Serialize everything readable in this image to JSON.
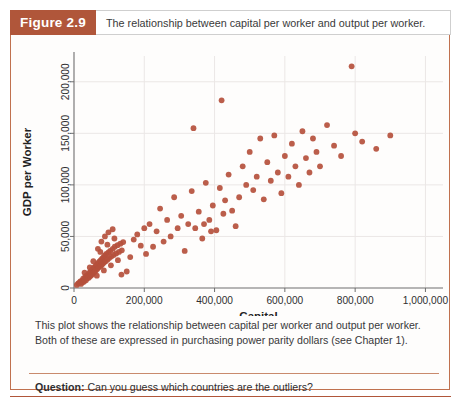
{
  "figure": {
    "tag_label": "Figure 2.9",
    "title": "The relationship between capital per worker and output per worker.",
    "caption": "This plot shows the relationship between capital per worker and output per worker. Both of these are expressed in purchasing power parity dollars (see Chapter 1).",
    "question_label": "Question:",
    "question_text": "Can you guess which countries are the outliers?"
  },
  "colors": {
    "banner": "#b0563a",
    "border": "#c0714f",
    "point": "#b5503c",
    "grid": "#ebe7e6",
    "axis": "#6e6e6e",
    "text": "#38383a"
  },
  "chart_data": {
    "type": "scatter",
    "title": "",
    "xlabel": "Capital",
    "ylabel": "GDP per Worker",
    "xlim": [
      0,
      1050000
    ],
    "ylim": [
      0,
      225000
    ],
    "grid": true,
    "legend": "none",
    "xticks": [
      0,
      200000,
      400000,
      600000,
      800000,
      1000000
    ],
    "xticklabels": [
      "0",
      "200,000",
      "400,000",
      "600,000",
      "800,000",
      "1,000,000"
    ],
    "yticks": [
      0,
      50000,
      100000,
      150000,
      200000
    ],
    "yticklabels": [
      "0",
      "50,000",
      "100,000",
      "150,000",
      "200,000"
    ],
    "points": [
      [
        8000,
        3000
      ],
      [
        12000,
        4500
      ],
      [
        15000,
        5000
      ],
      [
        18000,
        6500
      ],
      [
        20000,
        4000
      ],
      [
        22000,
        7000
      ],
      [
        24000,
        5500
      ],
      [
        26000,
        9000
      ],
      [
        28000,
        6000
      ],
      [
        30000,
        8000
      ],
      [
        32000,
        11000
      ],
      [
        34000,
        7500
      ],
      [
        36000,
        12000
      ],
      [
        38000,
        9500
      ],
      [
        40000,
        13000
      ],
      [
        42000,
        10000
      ],
      [
        44000,
        15000
      ],
      [
        46000,
        11500
      ],
      [
        48000,
        16000
      ],
      [
        50000,
        12500
      ],
      [
        52000,
        18000
      ],
      [
        54000,
        14000
      ],
      [
        56000,
        19500
      ],
      [
        58000,
        15500
      ],
      [
        60000,
        21000
      ],
      [
        62000,
        17000
      ],
      [
        64000,
        22500
      ],
      [
        66000,
        18500
      ],
      [
        68000,
        24000
      ],
      [
        70000,
        20000
      ],
      [
        72000,
        25500
      ],
      [
        74000,
        21000
      ],
      [
        76000,
        27000
      ],
      [
        78000,
        22000
      ],
      [
        80000,
        28500
      ],
      [
        82000,
        23500
      ],
      [
        84000,
        30000
      ],
      [
        86000,
        25000
      ],
      [
        88000,
        31500
      ],
      [
        90000,
        26000
      ],
      [
        92000,
        33000
      ],
      [
        95000,
        27500
      ],
      [
        98000,
        34500
      ],
      [
        100000,
        29000
      ],
      [
        103000,
        36000
      ],
      [
        106000,
        30500
      ],
      [
        110000,
        38000
      ],
      [
        113000,
        32000
      ],
      [
        116000,
        40000
      ],
      [
        120000,
        33500
      ],
      [
        124000,
        41500
      ],
      [
        128000,
        35000
      ],
      [
        132000,
        43000
      ],
      [
        136000,
        36500
      ],
      [
        140000,
        44500
      ],
      [
        30000,
        15000
      ],
      [
        45000,
        20000
      ],
      [
        55000,
        26000
      ],
      [
        65000,
        12000
      ],
      [
        75000,
        35000
      ],
      [
        85000,
        17000
      ],
      [
        95000,
        42000
      ],
      [
        105000,
        22000
      ],
      [
        115000,
        48000
      ],
      [
        125000,
        27000
      ],
      [
        68000,
        38000
      ],
      [
        78000,
        45000
      ],
      [
        88000,
        50000
      ],
      [
        98000,
        54000
      ],
      [
        110000,
        57000
      ],
      [
        135000,
        13000
      ],
      [
        150000,
        16000
      ],
      [
        160000,
        30000
      ],
      [
        170000,
        47000
      ],
      [
        180000,
        52000
      ],
      [
        190000,
        41000
      ],
      [
        200000,
        58000
      ],
      [
        205000,
        33000
      ],
      [
        215000,
        62000
      ],
      [
        225000,
        40000
      ],
      [
        235000,
        55000
      ],
      [
        245000,
        77000
      ],
      [
        255000,
        45000
      ],
      [
        265000,
        66000
      ],
      [
        275000,
        50000
      ],
      [
        285000,
        88000
      ],
      [
        295000,
        58000
      ],
      [
        305000,
        70000
      ],
      [
        315000,
        36000
      ],
      [
        325000,
        62000
      ],
      [
        335000,
        94000
      ],
      [
        345000,
        58000
      ],
      [
        355000,
        74000
      ],
      [
        365000,
        48000
      ],
      [
        375000,
        102000
      ],
      [
        385000,
        66000
      ],
      [
        395000,
        80000
      ],
      [
        405000,
        56000
      ],
      [
        415000,
        97000
      ],
      [
        425000,
        72000
      ],
      [
        340000,
        155000
      ],
      [
        420000,
        182000
      ],
      [
        470000,
        88000
      ],
      [
        480000,
        118000
      ],
      [
        490000,
        100000
      ],
      [
        500000,
        132000
      ],
      [
        510000,
        95000
      ],
      [
        520000,
        108000
      ],
      [
        530000,
        145000
      ],
      [
        540000,
        86000
      ],
      [
        550000,
        122000
      ],
      [
        560000,
        104000
      ],
      [
        570000,
        148000
      ],
      [
        580000,
        112000
      ],
      [
        590000,
        92000
      ],
      [
        600000,
        128000
      ],
      [
        610000,
        108000
      ],
      [
        620000,
        140000
      ],
      [
        630000,
        118000
      ],
      [
        640000,
        100000
      ],
      [
        650000,
        152000
      ],
      [
        660000,
        126000
      ],
      [
        670000,
        112000
      ],
      [
        680000,
        145000
      ],
      [
        690000,
        132000
      ],
      [
        700000,
        118000
      ],
      [
        720000,
        158000
      ],
      [
        740000,
        138000
      ],
      [
        760000,
        128000
      ],
      [
        790000,
        215000
      ],
      [
        800000,
        150000
      ],
      [
        820000,
        142000
      ],
      [
        860000,
        135000
      ],
      [
        900000,
        148000
      ],
      [
        450000,
        75000
      ],
      [
        460000,
        60000
      ],
      [
        430000,
        85000
      ],
      [
        440000,
        110000
      ],
      [
        370000,
        62000
      ],
      [
        390000,
        55000
      ]
    ]
  }
}
